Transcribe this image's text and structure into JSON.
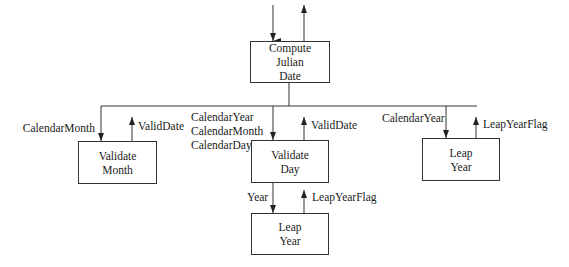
{
  "diagram": {
    "type": "structure-chart",
    "modules": {
      "compute": {
        "line1": "Compute",
        "line2": "Julian",
        "line3": "Date"
      },
      "validate_month": {
        "line1": "Validate",
        "line2": "Month"
      },
      "validate_day": {
        "line1": "Validate",
        "line2": "Day"
      },
      "leap_year_right": {
        "line1": "Leap",
        "line2": "Year"
      },
      "leap_year_bottom": {
        "line1": "Leap",
        "line2": "Year"
      }
    },
    "flows": {
      "vm_in": "CalendarMonth",
      "vm_out": "ValidDate",
      "vd_in_1": "CalendarYear",
      "vd_in_2": "CalendarMonth",
      "vd_in_3": "CalendarDay",
      "vd_out": "ValidDate",
      "ly_in": "CalendarYear",
      "ly_out": "LeapYearFlag",
      "lyb_in": "Year",
      "lyb_out": "LeapYearFlag"
    },
    "colors": {
      "line": "#333333",
      "text": "#1a1a1a",
      "background": "#ffffff"
    }
  }
}
